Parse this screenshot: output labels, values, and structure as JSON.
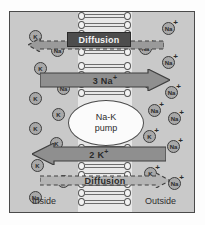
{
  "figure": {
    "colors": {
      "frame_border": "#4a4a4a",
      "cytosol_bg": "#c9c9c9",
      "membrane_bg": "#e8e8e8",
      "ion_fill": "#a8a8a8",
      "ion_border": "#3d3d3d",
      "arrow_fill": "#8f8f8f",
      "pump_fill": "#fbfbfb"
    }
  },
  "labels": {
    "inside": "Inside",
    "outside": "Outside",
    "pump_line1": "Na-K",
    "pump_line2": "pump",
    "diffusion_top": "Diffusion",
    "diffusion_bottom": "Diffusion",
    "sodium_transport": "3 Na",
    "sodium_transport_charge": "+",
    "potassium_transport": "2 K",
    "potassium_transport_charge": "+"
  },
  "membrane": {
    "name": "phospholipid-bilayer",
    "bands": [
      {
        "top": 0,
        "height": 50
      },
      {
        "top": 132,
        "height": 70
      }
    ],
    "upper_channel_band": {
      "top": 50,
      "height": 38
    }
  },
  "ions": {
    "inside": [
      {
        "label": "K",
        "charge": "",
        "x": 19,
        "y": 18
      },
      {
        "label": "Na",
        "charge": "",
        "x": 41,
        "y": 32
      },
      {
        "label": "K",
        "charge": "",
        "x": 24,
        "y": 50
      },
      {
        "label": "Na",
        "charge": "",
        "x": 47,
        "y": 70
      },
      {
        "label": "K",
        "charge": "",
        "x": 19,
        "y": 80
      },
      {
        "label": "K",
        "charge": "",
        "x": 42,
        "y": 96
      },
      {
        "label": "K",
        "charge": "",
        "x": 19,
        "y": 110
      },
      {
        "label": "K",
        "charge": "",
        "x": 40,
        "y": 125
      },
      {
        "label": "K",
        "charge": "",
        "x": 21,
        "y": 147
      },
      {
        "label": "K",
        "charge": "",
        "x": 47,
        "y": 163
      },
      {
        "label": "Na",
        "charge": "",
        "x": 19,
        "y": 179
      }
    ],
    "outside": [
      {
        "label": "Na",
        "charge": "+",
        "x": 152,
        "y": 10
      },
      {
        "label": "Na",
        "charge": "+",
        "x": 129,
        "y": 30
      },
      {
        "label": "Na",
        "charge": "+",
        "x": 152,
        "y": 44
      },
      {
        "label": "Na",
        "charge": "+",
        "x": 133,
        "y": 64
      },
      {
        "label": "Na",
        "charge": "+",
        "x": 155,
        "y": 74
      },
      {
        "label": "Na",
        "charge": "+",
        "x": 138,
        "y": 92
      },
      {
        "label": "Na",
        "charge": "+",
        "x": 158,
        "y": 100
      },
      {
        "label": "K",
        "charge": "+",
        "x": 133,
        "y": 118
      },
      {
        "label": "Na",
        "charge": "+",
        "x": 157,
        "y": 128
      },
      {
        "label": "K",
        "charge": "+",
        "x": 134,
        "y": 155
      },
      {
        "label": "Na",
        "charge": "+",
        "x": 158,
        "y": 165
      }
    ]
  }
}
